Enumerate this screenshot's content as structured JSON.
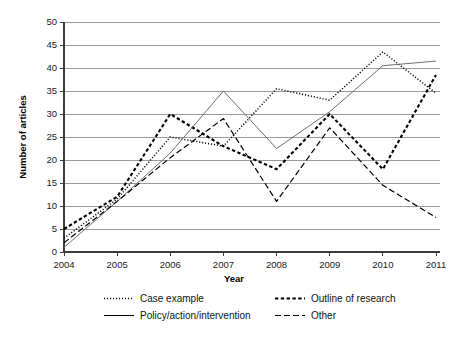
{
  "chart_data": {
    "type": "line",
    "title": "",
    "xlabel": "Year",
    "ylabel": "Number of articles",
    "categories": [
      "2004",
      "2005",
      "2006",
      "2007",
      "2008",
      "2009",
      "2010",
      "2011"
    ],
    "x": [
      2004,
      2005,
      2006,
      2007,
      2008,
      2009,
      2010,
      2011
    ],
    "xlim": [
      2004,
      2011
    ],
    "ylim": [
      0,
      50
    ],
    "yticks": [
      0,
      5,
      10,
      15,
      20,
      25,
      30,
      35,
      40,
      45,
      50
    ],
    "ytick_labels": [
      "0",
      "5",
      "10",
      "15",
      "20",
      "25",
      "30",
      "35",
      "40",
      "45",
      "50"
    ],
    "grid": "horizontal",
    "legend_position": "bottom",
    "series": [
      {
        "name": "Case example",
        "style": "dotted",
        "color": "#000000",
        "values": [
          3,
          11.5,
          25,
          23,
          35.5,
          33,
          43.5,
          34.5
        ]
      },
      {
        "name": "Outline of research",
        "style": "dashed",
        "color": "#000000",
        "values": [
          5,
          12,
          30,
          23,
          18,
          30,
          18,
          38.5
        ]
      },
      {
        "name": "Policy/action/intervention",
        "style": "solid",
        "color": "#6e6e6e",
        "values": [
          1,
          11,
          21.5,
          35,
          22.5,
          30.5,
          40.5,
          41.5
        ]
      },
      {
        "name": "Other",
        "style": "long-dash",
        "color": "#000000",
        "values": [
          2,
          11,
          20.5,
          29,
          11,
          27,
          14.5,
          7.5
        ]
      }
    ]
  },
  "axes": {
    "y_title": "Number of articles",
    "x_title": "Year"
  },
  "legend": {
    "items": [
      {
        "label": "Case example",
        "style": "dotted"
      },
      {
        "label": "Outline of research",
        "style": "dashed"
      },
      {
        "label": "Policy/action/intervention",
        "style": "solid"
      },
      {
        "label": "Other",
        "style": "long-dash"
      }
    ]
  }
}
